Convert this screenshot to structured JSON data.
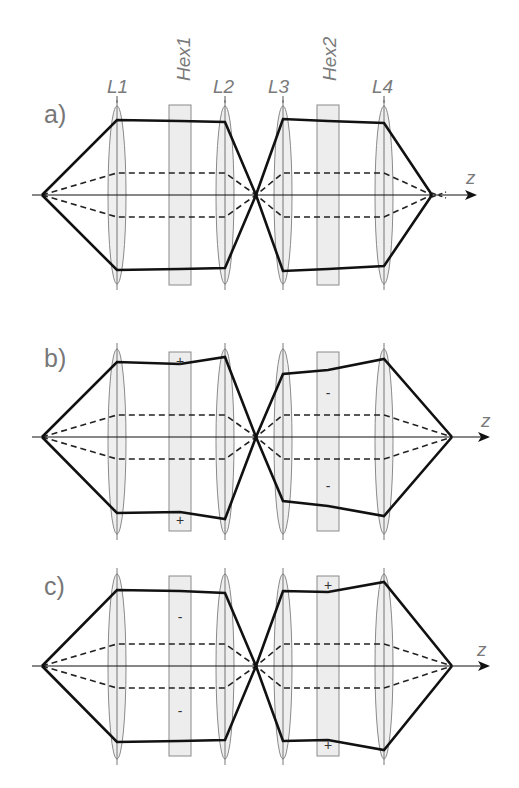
{
  "labels": {
    "lenses": [
      "L1",
      "L2",
      "L3",
      "L4"
    ],
    "hexapoles": [
      "Hex1",
      "Hex2"
    ],
    "axis": "z",
    "panels": [
      "a)",
      "b)",
      "c)"
    ]
  },
  "colors": {
    "ray": "#111111",
    "lens_fill": "#ececec",
    "lens_stroke": "#8a8a8a",
    "hex_fill": "#ededed",
    "hex_stroke": "#8a8a8a",
    "label": "#7a7a7a"
  },
  "geometry": {
    "x": {
      "source": 42,
      "L1": 117,
      "Hex1": 180,
      "L2": 225,
      "cross": 256,
      "L3": 283,
      "Hex2": 328,
      "L4": 384
    },
    "panels": [
      {
        "id": "a",
        "axis_y": 195,
        "focus_x": 432,
        "arrow_end": 475,
        "hex_top": 105,
        "hex_bot": 285,
        "lens_top": 100,
        "lens_bot": 290,
        "solid_top": [
          120,
          121,
          122,
          119,
          121,
          123
        ],
        "solid_bot": [
          270,
          269,
          268,
          271,
          269,
          266
        ],
        "hex1_signs": [
          "",
          ""
        ],
        "hex2_signs": [
          "",
          ""
        ]
      },
      {
        "id": "b",
        "axis_y": 437,
        "focus_x": 452,
        "arrow_end": 488,
        "hex_top": 352,
        "hex_bot": 531,
        "lens_top": 343,
        "lens_bot": 540,
        "solid_top": [
          362,
          364,
          357,
          374,
          370,
          359
        ],
        "solid_bot": [
          513,
          512,
          519,
          501,
          506,
          516
        ],
        "hex1_signs": [
          "+",
          "+"
        ],
        "hex2_signs": [
          "-",
          "-"
        ]
      },
      {
        "id": "c",
        "axis_y": 666,
        "focus_x": 452,
        "arrow_end": 488,
        "hex_top": 576,
        "hex_bot": 756,
        "lens_top": 568,
        "lens_bot": 765,
        "solid_top": [
          590,
          591,
          593,
          591,
          592,
          582
        ],
        "solid_bot": [
          742,
          741,
          740,
          741,
          740,
          750
        ],
        "hex1_signs": [
          "-",
          "-"
        ],
        "hex2_signs": [
          "+",
          "+"
        ]
      }
    ]
  }
}
